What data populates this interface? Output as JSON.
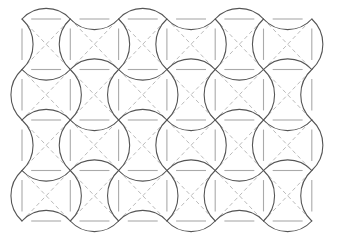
{
  "figure": {
    "type": "geometric-tiling-diagram",
    "background_color": "#ffffff"
  },
  "canvas": {
    "width": 337,
    "height": 245
  },
  "pattern": {
    "name": "pinwheel-arc-tessellation",
    "origin_x": 22,
    "origin_y": 19,
    "cell_width": 48.3,
    "cell_height": 50.5,
    "columns": 6,
    "rows": 4,
    "total_width": 290,
    "total_height": 202
  },
  "layers": {
    "construction_grid": {
      "label": "Construction grid",
      "color": "#aaaaaa",
      "stroke_width": 1.1,
      "dash": "none",
      "segment_fraction": 0.62,
      "description": "Short straight gray segments forming a broken square lattice"
    },
    "diagonals": {
      "label": "Construction diagonals",
      "color": "#bbbbbb",
      "stroke_width": 1.0,
      "dash": "4 3",
      "description": "Dashed gray diagonal lines crossing each cell corner to corner"
    },
    "arcs": {
      "label": "Curved tile boundaries",
      "color": "#555555",
      "stroke_width": 1.1,
      "dash": "none",
      "arc_radius_factor": 0.62,
      "description": "Dark circular arcs bulging alternately in and out to form concave-square pinwheel tiles"
    }
  },
  "colors": {
    "arc": "#555555",
    "grid": "#a8a8a8",
    "diagonal": "#bcbcbc",
    "background": "#ffffff"
  }
}
